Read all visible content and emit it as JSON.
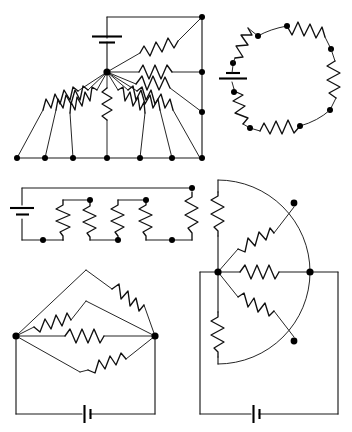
{
  "document": {
    "title": "Resistor Network Circuit Diagrams",
    "kind": "schematic-sheet",
    "width": 352,
    "height": 432,
    "background_color": "#ffffff",
    "ink_color": "#1a1a1a",
    "node_color": "#000000",
    "panel_count": 5
  },
  "panels": [
    {
      "id": "fan-network",
      "name": "Top-left fan / star resistor network",
      "position": "top-left",
      "description": "A single hub node driven by a battery fans out through many resistors to a row of seven bottom nodes and to a right-hand vertical rail.",
      "battery_count": 1,
      "hub_nodes": 1,
      "bottom_nodes": 7,
      "right_rail_nodes": 4,
      "resistor_count": 10,
      "hub": {
        "x": 107,
        "y": 72
      },
      "battery": {
        "x": 107,
        "y": 38,
        "orientation": "horizontal-plates"
      },
      "top_rail_y": 17,
      "bottom_rail_y": 158,
      "right_rail_x": 202,
      "bottom_node_xs": [
        17,
        45,
        73,
        107,
        140,
        172,
        200
      ],
      "right_node_ys": [
        17,
        72,
        112,
        158
      ],
      "fan_resistor_count_bottom": 7,
      "fan_resistor_count_right": 3
    },
    {
      "id": "ring-network",
      "name": "Top-right circular ring resistor network",
      "position": "top-right",
      "description": "Six resistors arranged around a circular loop with nodes between them and a battery inserted at the left of the ring.",
      "center": {
        "x": 284,
        "y": 78
      },
      "radius": 52,
      "resistor_count": 6,
      "node_count": 8,
      "battery_count": 1,
      "battery_angle_deg": 180,
      "battery": {
        "orientation": "horizontal-plates"
      }
    },
    {
      "id": "ladder-network",
      "name": "Middle-left parallel ladder network",
      "position": "middle-left",
      "description": "A battery on the left feeds a horizontal top rail and bottom rail with five vertical resistor branches in parallel.",
      "left_x": 22,
      "right_x": 192,
      "top_y": 188,
      "bottom_y": 240,
      "battery": {
        "x": 22,
        "y": 214,
        "orientation": "horizontal-plates"
      },
      "resistor_count": 5,
      "resistor_xs": [
        63,
        89,
        117,
        143,
        170
      ],
      "node_count": 6
    },
    {
      "id": "bridge-diamond",
      "name": "Bottom-left diamond bridge network",
      "position": "bottom-left",
      "description": "Left and right terminal nodes joined by four parallel resistor paths forming stacked diamond shapes, closed by a battery along the bottom wire.",
      "left_node": {
        "x": 16,
        "y": 336
      },
      "right_node": {
        "x": 155,
        "y": 336
      },
      "apex_top": {
        "x": 86,
        "y": 272
      },
      "apex_mid": {
        "x": 86,
        "y": 302
      },
      "apex_bottom": {
        "x": 86,
        "y": 372
      },
      "bottom_rail_y": 414,
      "battery": {
        "x": 86,
        "y": 414,
        "orientation": "vertical-plates"
      },
      "resistor_count": 5,
      "node_count": 2
    },
    {
      "id": "sector-network",
      "name": "Bottom-right semicircular sector network",
      "position": "bottom-right",
      "description": "A semicircular arc with a central hub node radiating resistors to arc nodes, plus vertical resistors on the chord, closed by a battery along the bottom wire.",
      "hub": {
        "x": 218,
        "y": 272
      },
      "arc_center": {
        "x": 218,
        "y": 272
      },
      "arc_radius": 108,
      "arc_span_deg": 180,
      "right_node": {
        "x": 326,
        "y": 272
      },
      "arc_node_upper": {
        "x": 294,
        "y": 198
      },
      "arc_node_lower": {
        "x": 294,
        "y": 348
      },
      "chord_x": 218,
      "bottom_rail_y": 414,
      "battery": {
        "x": 255,
        "y": 414,
        "orientation": "vertical-plates"
      },
      "resistor_count": 6,
      "node_count": 4
    }
  ],
  "symbols": {
    "resistor": "zigzag",
    "battery": "parallel-plates",
    "node": "filled-dot",
    "wire": "straight-line",
    "arc": "circular-arc"
  },
  "legend": {
    "resistor_label": "Resistor",
    "battery_label": "Battery / voltage source",
    "node_label": "Junction node",
    "wire_label": "Conductor"
  },
  "totals": {
    "resistors": 32,
    "batteries": 5,
    "nodes": 31
  }
}
